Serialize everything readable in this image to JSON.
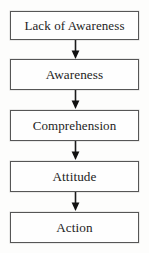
{
  "diagram": {
    "type": "vertical-flowchart",
    "title": "",
    "background_color": "#fdfdfc",
    "box_border_color": "#565656",
    "text_color": "#232323",
    "arrow_color": "#1b1b1b",
    "nodes": [
      {
        "id": "node-1",
        "label": "Lack of Awareness"
      },
      {
        "id": "node-2",
        "label": "Awareness"
      },
      {
        "id": "node-3",
        "label": "Comprehension"
      },
      {
        "id": "node-4",
        "label": "Attitude"
      },
      {
        "id": "node-5",
        "label": "Action"
      }
    ],
    "connectors": [
      {
        "id": "arrow-1",
        "from": "node-1",
        "to": "node-2",
        "icon": "arrow-down-icon"
      },
      {
        "id": "arrow-2",
        "from": "node-2",
        "to": "node-3",
        "icon": "arrow-down-icon"
      },
      {
        "id": "arrow-3",
        "from": "node-3",
        "to": "node-4",
        "icon": "arrow-down-icon"
      },
      {
        "id": "arrow-4",
        "from": "node-4",
        "to": "node-5",
        "icon": "arrow-down-icon"
      }
    ]
  }
}
